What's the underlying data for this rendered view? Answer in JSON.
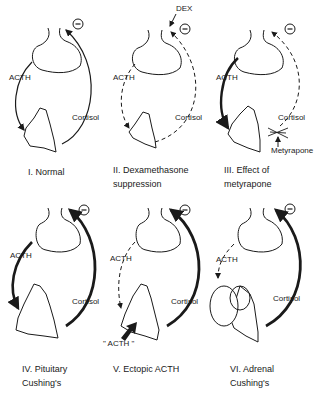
{
  "figure": {
    "panels": [
      {
        "id": "I",
        "caption": "I. Normal",
        "acth": "ACTH",
        "cortisol": "Cortisol",
        "inhibit": "−"
      },
      {
        "id": "II",
        "caption": "II. Dexamethasone\nsuppression",
        "acth": "ACTH",
        "cortisol": "Cortisol",
        "inhibit": "−",
        "drug": "DEX"
      },
      {
        "id": "III",
        "caption": "III. Effect of\nmetyrapone",
        "acth": "ACTH",
        "cortisol": "Cortisol",
        "inhibit": "−",
        "drug": "Metyrapone"
      },
      {
        "id": "IV",
        "caption": "IV. Pituitary\nCushing's",
        "acth": "ACTH",
        "cortisol": "Cortisol",
        "inhibit": "−"
      },
      {
        "id": "V",
        "caption": "V. Ectopic ACTH",
        "acth": "ACTH",
        "cortisol": "Cortisol",
        "inhibit": "−",
        "ectopic": "\" ACTH \""
      },
      {
        "id": "VI",
        "caption": "VI. Adrenal\nCushing's",
        "acth": "ACTH",
        "cortisol": "Cortisol",
        "inhibit": "−"
      }
    ]
  }
}
